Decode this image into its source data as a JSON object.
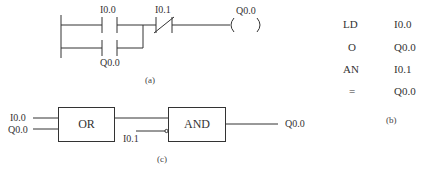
{
  "ladder": {
    "contact_no_1": "I0.0",
    "contact_no_2": "Q0.0",
    "contact_nc": "I0.1",
    "coil": "Q0.0",
    "caption": "(a)"
  },
  "instruction_list": {
    "rows": [
      {
        "op": "LD",
        "operand": "I0.0"
      },
      {
        "op": "O",
        "operand": "Q0.0"
      },
      {
        "op": "AN",
        "operand": "I0.1"
      },
      {
        "op": "=",
        "operand": "Q0.0"
      }
    ],
    "caption": "(b)"
  },
  "function_block": {
    "or_label": "OR",
    "and_label": "AND",
    "input_1": "I0.0",
    "input_2": "Q0.0",
    "input_negated": "I0.1",
    "output": "Q0.0",
    "caption": "(c)"
  },
  "colors": {
    "line": "#333333",
    "background": "#ffffff"
  }
}
